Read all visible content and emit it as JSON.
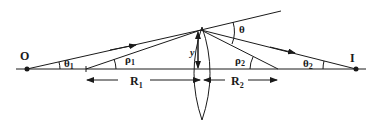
{
  "diagram": {
    "labels": {
      "object": "O",
      "image": "I",
      "theta": "θ",
      "theta1": "θ",
      "theta1_sub": "1",
      "theta2": "θ",
      "theta2_sub": "2",
      "rho1": "ρ",
      "rho1_sub": "1",
      "rho2": "ρ",
      "rho2_sub": "2",
      "y": "y",
      "R1": "R",
      "R1_sub": "1",
      "R2": "R",
      "R2_sub": "2"
    },
    "colors": {
      "line": "#1a1a1a",
      "background": "#ffffff"
    }
  }
}
